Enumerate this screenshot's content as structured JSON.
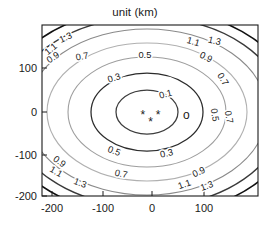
{
  "chart_data": {
    "type": "line",
    "subtype": "contour",
    "title": "unit (km)",
    "xlabel": "",
    "ylabel": "",
    "xlim": [
      -230,
      175
    ],
    "ylim": [
      -200,
      205
    ],
    "xticks": [
      -200,
      -100,
      0,
      100
    ],
    "yticks": [
      100,
      0,
      -100,
      -200
    ],
    "xtick_labels": [
      "-200",
      "-100",
      "0",
      "100"
    ],
    "ytick_labels": [
      "100",
      "0",
      "-100",
      "-200"
    ],
    "grid": false,
    "legend": null,
    "levels": [
      0.1,
      0.3,
      0.5,
      0.7,
      0.9,
      1.1,
      1.3
    ],
    "level_labels": [
      "0.1",
      "0.3",
      "0.5",
      "0.7",
      "0.9",
      "1.1",
      "1.3"
    ],
    "level_colors": [
      "#3d3d3d",
      "#2b2b2b",
      "#9e9e9e",
      "#b0b0b0",
      "#8a8a8a",
      "#3a3a3a",
      "#111111"
    ],
    "center": [
      -5,
      -10
    ],
    "contour_labels": [
      {
        "text": "1.3",
        "x": -168,
        "y": 168,
        "rot": -24
      },
      {
        "text": "1.1",
        "x": -196,
        "y": 142,
        "rot": -40
      },
      {
        "text": "0.9",
        "x": -192,
        "y": 122,
        "rot": -34
      },
      {
        "text": "0.7",
        "x": -137,
        "y": 123,
        "rot": -9
      },
      {
        "text": "0.5",
        "x": -14,
        "y": 127,
        "rot": 0
      },
      {
        "text": "0.3",
        "x": -73,
        "y": 73,
        "rot": -18
      },
      {
        "text": "0.1",
        "x": 28,
        "y": 35,
        "rot": -14
      },
      {
        "text": "1.1",
        "x": 80,
        "y": 158,
        "rot": 16
      },
      {
        "text": "1.3",
        "x": 122,
        "y": 160,
        "rot": 14
      },
      {
        "text": "0.9",
        "x": 104,
        "y": 122,
        "rot": 26
      },
      {
        "text": "0.7",
        "x": 135,
        "y": 73,
        "rot": 58
      },
      {
        "text": "0.5",
        "x": 118,
        "y": -8,
        "rot": 80
      },
      {
        "text": "0.7",
        "x": 146,
        "y": -13,
        "rot": 80
      },
      {
        "text": "0.5",
        "x": -77,
        "y": -98,
        "rot": 22
      },
      {
        "text": "0.3",
        "x": 30,
        "y": -104,
        "rot": -12
      },
      {
        "text": "0.9",
        "x": -186,
        "y": -122,
        "rot": 36
      },
      {
        "text": "1.1",
        "x": -192,
        "y": -146,
        "rot": 30
      },
      {
        "text": "0.7",
        "x": -62,
        "y": -152,
        "rot": 12
      },
      {
        "text": "1.3",
        "x": -144,
        "y": -173,
        "rot": 22
      },
      {
        "text": "0.9",
        "x": 95,
        "y": -147,
        "rot": -26
      },
      {
        "text": "1.1",
        "x": 66,
        "y": -176,
        "rot": -20
      },
      {
        "text": "1.3",
        "x": 110,
        "y": -180,
        "rot": -20
      }
    ],
    "markers": [
      {
        "symbol": "*",
        "x": -18,
        "y": -6,
        "name": "asterisk-marker-1"
      },
      {
        "symbol": "*",
        "x": 12,
        "y": -6,
        "name": "asterisk-marker-2"
      },
      {
        "symbol": "*",
        "x": -3,
        "y": -24,
        "name": "asterisk-marker-3"
      },
      {
        "symbol": "o",
        "x": 68,
        "y": -8,
        "name": "circle-marker-1"
      }
    ]
  }
}
